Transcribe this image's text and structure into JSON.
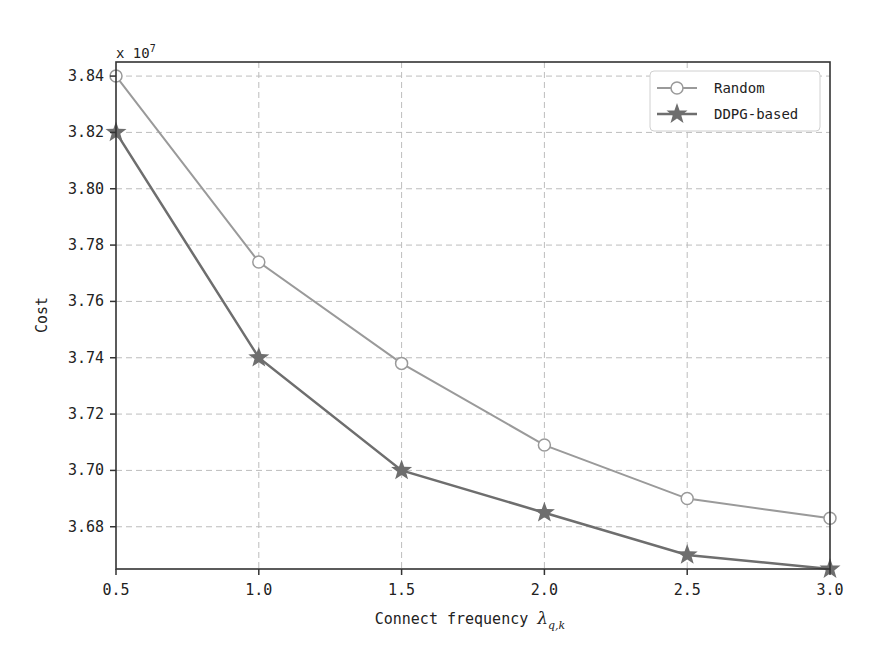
{
  "chart_data": {
    "type": "line",
    "title": "",
    "xlabel": "Connect frequency λ_{q,k}",
    "xlabel_main": "Connect frequency ",
    "xlabel_symbol": "λ",
    "xlabel_sub": "q,k",
    "ylabel": "Cost",
    "y_multiplier": "x 10",
    "y_multiplier_exp": "7",
    "x": [
      0.5,
      1.0,
      1.5,
      2.0,
      2.5,
      3.0
    ],
    "xticks": [
      "0.5",
      "1.0",
      "1.5",
      "2.0",
      "2.5",
      "3.0"
    ],
    "yticks": [
      "3.84",
      "3.82",
      "3.80",
      "3.78",
      "3.76",
      "3.74",
      "3.72",
      "3.70",
      "3.68"
    ],
    "ytick_values": [
      3.84,
      3.82,
      3.8,
      3.78,
      3.76,
      3.74,
      3.72,
      3.7,
      3.68
    ],
    "xlim": [
      0.5,
      3.0
    ],
    "ylim": [
      3.665,
      3.845
    ],
    "grid": true,
    "legend_position": "upper right",
    "series": [
      {
        "name": "Random",
        "marker": "circle-open",
        "color": "#9a9a9a",
        "values": [
          3.84,
          3.774,
          3.738,
          3.709,
          3.69,
          3.683
        ]
      },
      {
        "name": "DDPG-based",
        "marker": "star",
        "color": "#6e6e6e",
        "values": [
          3.82,
          3.74,
          3.7,
          3.685,
          3.67,
          3.665
        ]
      }
    ]
  }
}
